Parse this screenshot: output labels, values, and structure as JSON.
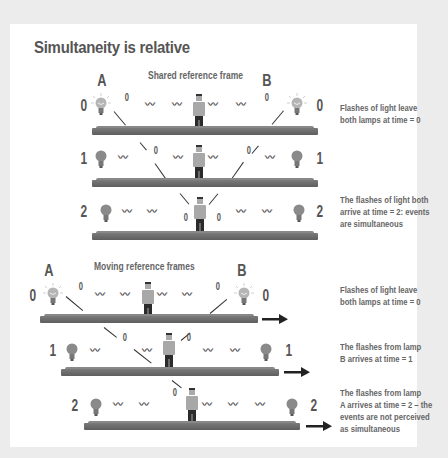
{
  "title": "Simultaneity is relative",
  "shared": {
    "label": "Shared reference frame",
    "lamp_a": "A",
    "lamp_b": "B",
    "rows": [
      {
        "time": "0",
        "left_pulse": "0",
        "right_pulse": "0",
        "note": [
          "Flashes of light leave",
          "both lamps at time = 0"
        ]
      },
      {
        "time": "1",
        "left_pulse": "0",
        "right_pulse": "0",
        "note": []
      },
      {
        "time": "2",
        "left_pulse": "0",
        "right_pulse": "0",
        "note": [
          "The flashes of light both",
          "arrive at time = 2: events",
          "are simultaneous"
        ]
      }
    ]
  },
  "moving": {
    "label": "Moving reference frames",
    "lamp_a": "A",
    "lamp_b": "B",
    "rows": [
      {
        "time": "0",
        "left_pulse": "0",
        "right_pulse": "0",
        "note": [
          "Flashes of light leave",
          "both lamps at time = 0"
        ]
      },
      {
        "time": "1",
        "left_pulse": "0",
        "right_pulse": "0",
        "note": [
          "The flashes from lamp",
          "B arrives at time = 1"
        ]
      },
      {
        "time": "2",
        "left_pulse": "0",
        "note": [
          "The flashes from lamp",
          "A arrives at time = 2 – the",
          "events are not perceived",
          "as simultaneous"
        ]
      }
    ]
  },
  "icons": {
    "lamp_lit": "lightbulb-lit-icon",
    "lamp_off": "lightbulb-off-icon",
    "observer": "person-icon",
    "direction": "right-arrow-icon",
    "wave": "light-wave-icon"
  },
  "wave_glyph": "∿",
  "colors": {
    "background": "#ececec",
    "card": "#ffffff",
    "text": "#555555",
    "platform": "#6b6b6b",
    "person_shirt": "#a8a8a8",
    "person_pants": "#2b2b2b",
    "lamp_glass": "#9a9a9a",
    "lamp_glow": "#d4d4d4"
  }
}
